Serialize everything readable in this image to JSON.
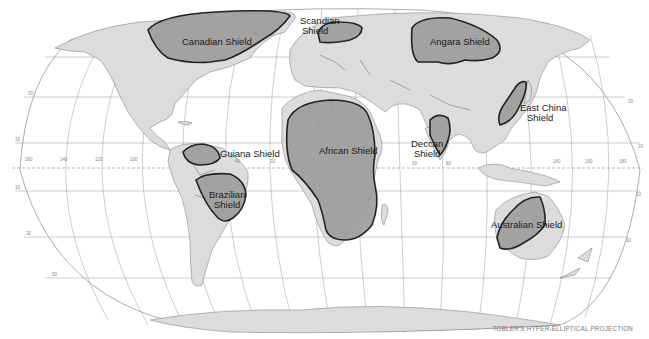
{
  "map": {
    "projection_caption": "TOBLER'S HYPER-ELLIPTICAL PROJECTION",
    "colors": {
      "land": "#dcdcdc",
      "shield_fill": "#9c9c9c",
      "shield_outline": "#222222",
      "ocean": "#ffffff",
      "graticule": "#9a9a9a"
    },
    "shields": [
      {
        "id": "canadian",
        "label": "Canadian Shield"
      },
      {
        "id": "scandian",
        "label_line1": "Scandian",
        "label_line2": "Shield"
      },
      {
        "id": "angara",
        "label": "Angara Shield"
      },
      {
        "id": "guiana",
        "label": "Guiana Shield"
      },
      {
        "id": "brazilian",
        "label_line1": "Brazilian",
        "label_line2": "Shield"
      },
      {
        "id": "african",
        "label": "African Shield"
      },
      {
        "id": "deccan",
        "label_line1": "Deccan",
        "label_line2": "Shield"
      },
      {
        "id": "east-china",
        "label_line1": "East China",
        "label_line2": "Shield"
      },
      {
        "id": "australian",
        "label": "Australian Shield"
      }
    ],
    "longitude_labels": [
      "160",
      "140",
      "120",
      "100",
      "40",
      "20",
      "60",
      "80",
      "140",
      "160",
      "180"
    ],
    "latitude_labels": [
      "30",
      "10",
      "10",
      "30",
      "50",
      "30",
      "10",
      "10",
      "30"
    ]
  }
}
